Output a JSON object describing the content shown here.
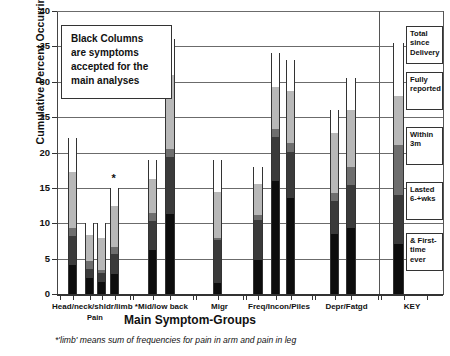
{
  "chart_data": {
    "type": "bar",
    "title": "",
    "xlabel": "Main Symptom-Groups",
    "ylabel": "Cumulative Percent Occurring within...",
    "ylim": [
      0,
      40
    ],
    "yticks": [
      0,
      5,
      10,
      15,
      20,
      25,
      30,
      35,
      40
    ],
    "grid": true,
    "stacked": true,
    "legend_position": "right-inside-KEY-panel",
    "series": [
      {
        "name": "& First-time ever",
        "color": "#0d0d0d"
      },
      {
        "name": "Lasted 6-+wks",
        "color": "#3a3a3a"
      },
      {
        "name": "Within 3m",
        "color": "#6e6e6e"
      },
      {
        "name": "Fully reported",
        "color": "#b8b8b8"
      },
      {
        "name": "Total since Delivery",
        "color": "#ffffff"
      }
    ],
    "groups": [
      {
        "label": "Head/neck/shldr/limb *",
        "sublabel": "Pain",
        "bars": [
          {
            "name": "bar-head",
            "total": 22.0,
            "marked": false,
            "cumulative": [
              4.1,
              8.2,
              9.3,
              17.2,
              22.0
            ]
          },
          {
            "name": "bar-neck",
            "total": 10.0,
            "marked": false,
            "cumulative": [
              2.2,
              3.6,
              4.6,
              8.3,
              10.0
            ]
          },
          {
            "name": "bar-shoulder",
            "total": 10.0,
            "marked": false,
            "cumulative": [
              1.7,
              3.0,
              3.4,
              7.9,
              10.0
            ]
          },
          {
            "name": "bar-limb",
            "total": 15.0,
            "marked": true,
            "cumulative": [
              2.8,
              5.7,
              6.6,
              12.5,
              15.0
            ]
          }
        ]
      },
      {
        "label": "Mid/low back",
        "sublabel": "",
        "bars": [
          {
            "name": "bar-mid-back",
            "total": 19.0,
            "marked": false,
            "cumulative": [
              6.2,
              10.3,
              11.4,
              16.2,
              19.0
            ]
          },
          {
            "name": "bar-low-back",
            "total": 36.0,
            "marked": false,
            "cumulative": [
              11.3,
              19.3,
              20.5,
              31.0,
              36.0
            ]
          }
        ]
      },
      {
        "label": "Migr",
        "sublabel": "",
        "bars": [
          {
            "name": "bar-migraine",
            "total": 19.0,
            "marked": false,
            "cumulative": [
              1.6,
              7.7,
              7.9,
              14.4,
              19.0
            ]
          }
        ]
      },
      {
        "label": "Freq/Incon/Piles",
        "sublabel": "",
        "bars": [
          {
            "name": "bar-frequency",
            "total": 17.9,
            "marked": false,
            "cumulative": [
              4.8,
              10.4,
              11.1,
              15.6,
              17.9
            ]
          },
          {
            "name": "bar-incontinence",
            "total": 34.0,
            "marked": false,
            "cumulative": [
              15.9,
              22.2,
              23.3,
              29.2,
              34.0
            ]
          },
          {
            "name": "bar-piles",
            "total": 33.1,
            "marked": false,
            "cumulative": [
              13.5,
              20.1,
              21.4,
              28.7,
              33.1
            ]
          }
        ]
      },
      {
        "label": "Depr/Fatgd",
        "sublabel": "",
        "bars": [
          {
            "name": "bar-depression",
            "total": 26.0,
            "marked": false,
            "cumulative": [
              8.5,
              13.1,
              14.3,
              22.7,
              26.0
            ]
          },
          {
            "name": "bar-fatigued",
            "total": 30.5,
            "marked": false,
            "cumulative": [
              9.3,
              15.4,
              18.0,
              26.0,
              30.5
            ]
          }
        ]
      },
      {
        "label": "KEY",
        "sublabel": "",
        "bars": []
      }
    ]
  },
  "annotation": {
    "lines": [
      "Black Columns",
      "are symptoms",
      "accepted for the",
      "main analyses"
    ]
  },
  "key_panel": {
    "title": "KEY",
    "bar": {
      "total": 35.5,
      "cumulative": [
        7.0,
        14.0,
        21.0,
        28.0,
        35.5
      ]
    },
    "entries": [
      {
        "name": "key-total-since-delivery",
        "lines": [
          "Total",
          "since",
          "Delivery"
        ]
      },
      {
        "name": "key-fully-reported",
        "lines": [
          "Fully",
          "reported"
        ]
      },
      {
        "name": "key-within-3m",
        "lines": [
          "Within",
          "3m"
        ]
      },
      {
        "name": "key-lasted-6wks",
        "lines": [
          "Lasted",
          "6-+wks"
        ]
      },
      {
        "name": "key-first-time-ever",
        "lines": [
          "& First-",
          "time ever"
        ]
      }
    ]
  },
  "footnote": {
    "text": "*'limb' means sum of frequencies for pain in arm and pain in leg"
  },
  "star_marker": {
    "glyph": "*"
  }
}
